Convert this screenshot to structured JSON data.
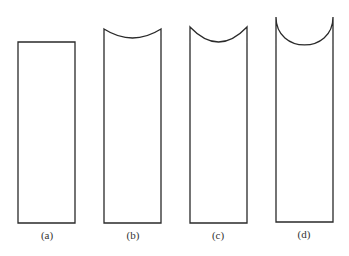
{
  "figure": {
    "panels": [
      {
        "id": "a",
        "label": "(a)",
        "x": 18,
        "w": 57,
        "top": 42,
        "dip": 0,
        "bottom": 223,
        "label_x": 47,
        "label_y": 229
      },
      {
        "id": "b",
        "label": "(b)",
        "x": 104,
        "w": 57,
        "top": 29,
        "dip": 9,
        "bottom": 223,
        "label_x": 133,
        "label_y": 229
      },
      {
        "id": "c",
        "label": "(c)",
        "x": 190,
        "w": 57,
        "top": 27,
        "dip": 15,
        "bottom": 223,
        "label_x": 218,
        "label_y": 229
      },
      {
        "id": "d",
        "label": "(d)",
        "x": 276,
        "w": 57,
        "top": 17,
        "dip": 28,
        "bottom": 222,
        "label_x": 304,
        "label_y": 228
      }
    ],
    "colors": {
      "stroke": "#2a2a2a",
      "background": "#ffffff"
    }
  }
}
